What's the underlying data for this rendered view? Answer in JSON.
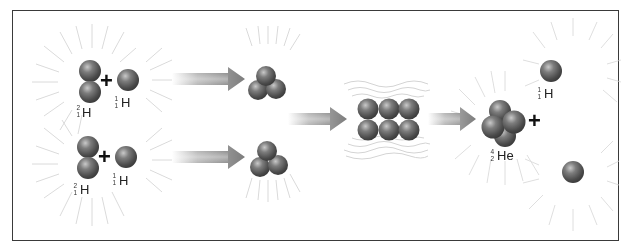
{
  "diagram": {
    "colors": {
      "frame": "#3a3a3a",
      "sphere": "#6a6a6a",
      "arrow": "#8a8a8a",
      "glow": "#d8d8d8"
    },
    "stage1": {
      "top": {
        "reactant_a": {
          "symbol": "H",
          "mass": "2",
          "atomic": "1"
        },
        "plus": "+",
        "reactant_b": {
          "symbol": "H",
          "mass": "1",
          "atomic": "1"
        }
      },
      "bottom": {
        "reactant_a": {
          "symbol": "H",
          "mass": "2",
          "atomic": "1"
        },
        "plus": "+",
        "reactant_b": {
          "symbol": "H",
          "mass": "1",
          "atomic": "1"
        }
      }
    },
    "stage4": {
      "product_main": {
        "symbol": "He",
        "mass": "4",
        "atomic": "2"
      },
      "plus": "+",
      "product_proton_top": {
        "symbol": "H",
        "mass": "1",
        "atomic": "1"
      }
    }
  }
}
